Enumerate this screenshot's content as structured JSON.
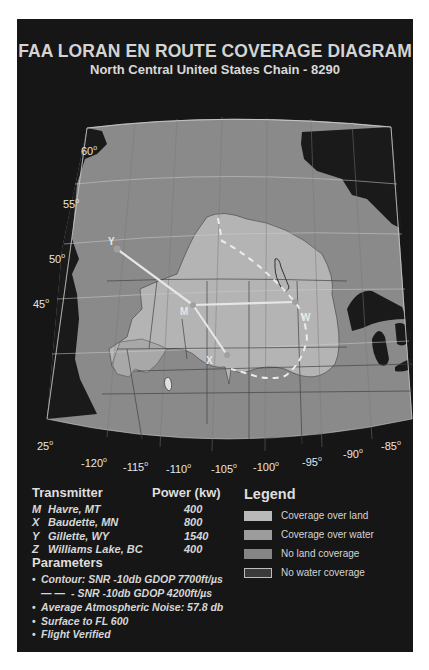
{
  "header": {
    "title": "FAA LORAN EN ROUTE COVERAGE DIAGRAM",
    "subtitle": "North Central United States Chain - 8290"
  },
  "map": {
    "latitude_labels": [
      "60",
      "55",
      "50",
      "45",
      "25"
    ],
    "longitude_labels": [
      "-120",
      "-115",
      "-110",
      "-105",
      "-100",
      "-95",
      "-90",
      "-85"
    ],
    "degree_symbol": "o",
    "station_markers": [
      {
        "label": "Y"
      },
      {
        "label": "M"
      },
      {
        "label": "X"
      },
      {
        "label": "W"
      }
    ],
    "colors": {
      "panel_background": "#161616",
      "land_no_coverage": "#8a8a8a",
      "land_coverage": "#b4b4b4",
      "water_dark": "#1a1a1a",
      "water_no_coverage_region": "#777777",
      "baseline": "#e6e6e6"
    }
  },
  "transmitters": {
    "header_name": "Transmitter",
    "header_power": "Power (kw)",
    "rows": [
      {
        "code": "M",
        "name": "Havre, MT",
        "power": "400"
      },
      {
        "code": "X",
        "name": "Baudette, MN",
        "power": "800"
      },
      {
        "code": "Y",
        "name": "Gillette, WY",
        "power": "1540"
      },
      {
        "code": "Z",
        "name": "Williams Lake, BC",
        "power": "400"
      }
    ]
  },
  "parameters": {
    "header": "Parameters",
    "items": [
      {
        "bullet": "•",
        "text": "Contour: SNR -10db GDOP 7700ft/µs"
      },
      {
        "bullet": "— —",
        "text": "- SNR -10db GDOP 4200ft/µs"
      },
      {
        "bullet": "•",
        "text": "Average Atmospheric Noise: 57.8 db"
      },
      {
        "bullet": "•",
        "text": "Surface to FL 600"
      },
      {
        "bullet": "•",
        "text": "Flight Verified"
      }
    ]
  },
  "legend": {
    "title": "Legend",
    "items": [
      {
        "label": "Coverage over land",
        "color": "#b9b9b9"
      },
      {
        "label": "Coverage over water",
        "color": "#9c9c9c"
      },
      {
        "label": "No land coverage",
        "color": "#858585"
      },
      {
        "label": "No water coverage",
        "color": "#3a3a3a"
      }
    ]
  }
}
